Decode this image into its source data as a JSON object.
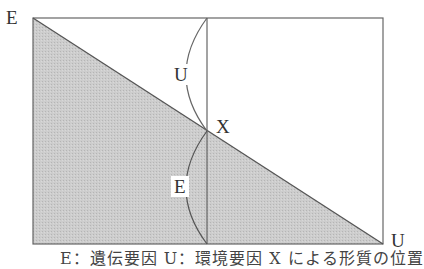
{
  "diagram": {
    "labels": {
      "top_left": "E",
      "bottom_right": "U",
      "intersection": "X",
      "upper_arc": "U",
      "lower_arc": "E"
    },
    "caption": "E：遺伝要因 U：環境要因 X による形質の位置",
    "colors": {
      "shade": "#c8c8c8",
      "line": "#555555",
      "background": "#ffffff"
    }
  }
}
